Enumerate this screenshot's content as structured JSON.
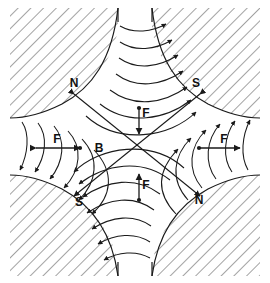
{
  "figure": {
    "background_color": "#ffffff",
    "line_color": "#1a1a1a",
    "hatch_color": "#555555",
    "width": 270,
    "height": 283
  },
  "poles": [
    {
      "id": "pole-top-left",
      "label": "N",
      "x": 74,
      "y": 87,
      "quadrant": "top-left"
    },
    {
      "id": "pole-top-right",
      "label": "S",
      "x": 196,
      "y": 87,
      "quadrant": "top-right"
    },
    {
      "id": "pole-bottom-left",
      "label": "S",
      "x": 79,
      "y": 206,
      "quadrant": "bottom-left"
    },
    {
      "id": "pole-bottom-right",
      "label": "N",
      "x": 199,
      "y": 204,
      "quadrant": "bottom-right"
    }
  ],
  "field_labels": [
    {
      "id": "field-label-b",
      "label": "B",
      "x": 99,
      "y": 152,
      "kind": "magnetic-flux-density"
    }
  ],
  "force_labels": [
    {
      "id": "force-label-top",
      "label": "F",
      "x": 146,
      "y": 113,
      "direction": "down"
    },
    {
      "id": "force-label-bottom",
      "label": "F",
      "x": 146,
      "y": 185,
      "direction": "up"
    },
    {
      "id": "force-label-left",
      "label": "F",
      "x": 57,
      "y": 140,
      "direction": "right"
    },
    {
      "id": "force-label-right",
      "label": "F",
      "x": 224,
      "y": 140,
      "direction": "right"
    }
  ],
  "force_arrows": [
    {
      "id": "force-arrow-top",
      "x1": 139,
      "y1": 108,
      "x2": 139,
      "y2": 133,
      "head": "end",
      "dot": "start"
    },
    {
      "id": "force-arrow-bottom",
      "x1": 139,
      "y1": 199,
      "x2": 139,
      "y2": 174,
      "head": "end",
      "dot": "start"
    },
    {
      "id": "force-arrow-left",
      "x1": 36,
      "y1": 148,
      "x2": 79,
      "y2": 148,
      "head": "both",
      "dot": "end"
    },
    {
      "id": "force-arrow-right",
      "x1": 199,
      "y1": 148,
      "x2": 239,
      "y2": 148,
      "head": "end",
      "dot": "start"
    }
  ],
  "diagonals": [
    {
      "id": "diagonal-nw-se",
      "x1": 72,
      "y1": 92,
      "x2": 202,
      "y2": 198,
      "arrow_ends": "both"
    },
    {
      "id": "diagonal-ne-sw",
      "x1": 202,
      "y1": 92,
      "x2": 72,
      "y2": 198,
      "arrow_ends": "both"
    }
  ],
  "gaps": [
    {
      "id": "gap-top",
      "field_direction": "left-to-right, arrowheads at right (into S pole)"
    },
    {
      "id": "gap-bottom",
      "field_direction": "right-to-left, arrowheads at left (into S pole)"
    },
    {
      "id": "gap-left",
      "field_direction": "top-to-bottom, arrowheads at bottom (into S pole)"
    },
    {
      "id": "gap-right",
      "field_direction": "bottom-to-top, arrowheads at top (into S pole)"
    }
  ]
}
